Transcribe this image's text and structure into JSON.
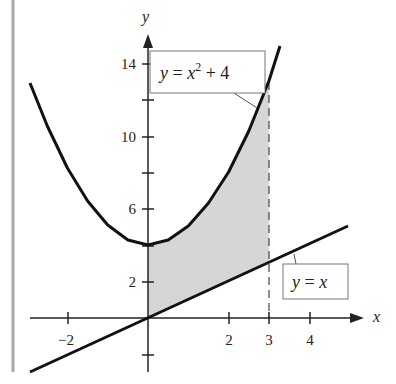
{
  "figure": {
    "axes": {
      "x_label": "x",
      "y_label": "y",
      "x_ticks": [
        {
          "value": -2,
          "label": "−2"
        },
        {
          "value": 2,
          "label": "2"
        },
        {
          "value": 3,
          "label": "3"
        },
        {
          "value": 4,
          "label": "4"
        }
      ],
      "y_ticks": [
        {
          "value": 2,
          "label": "2"
        },
        {
          "value": 6,
          "label": "6"
        },
        {
          "value": 10,
          "label": "10"
        },
        {
          "value": 14,
          "label": "14"
        }
      ]
    },
    "curves": [
      {
        "name": "parabola",
        "equation_label": "y = x² + 4",
        "eq_y": "y",
        "eq_eq": " = ",
        "eq_x": "x",
        "eq_exp": "2",
        "eq_rest": " + 4"
      },
      {
        "name": "line",
        "equation_label": "y = x",
        "eq_y": "y",
        "eq_eq": " = ",
        "eq_x": "x"
      }
    ],
    "shaded_region": {
      "description": "Region between y = x² + 4 and y = x from x = 0 to x = 3",
      "x_from": 0,
      "x_to": 3,
      "fill": "#d6d6d6"
    },
    "dashed_line": {
      "x": 3
    }
  }
}
